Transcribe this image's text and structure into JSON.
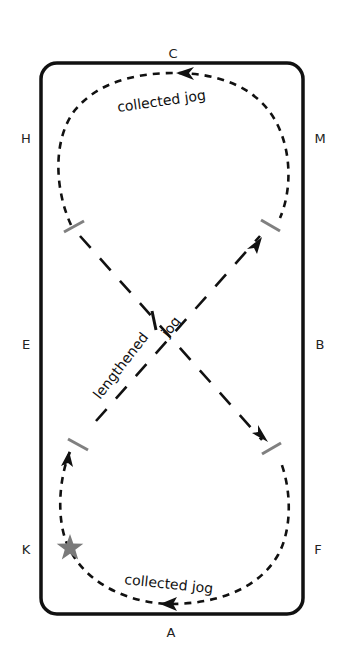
{
  "diagram": {
    "type": "dressage-figure",
    "figure": "figure-eight with collected jog circles and lengthened jog diagonals",
    "arena_letters": {
      "top": "C",
      "bottom": "A",
      "left": [
        "H",
        "E",
        "K"
      ],
      "right": [
        "M",
        "B",
        "F"
      ]
    },
    "letters": [
      {
        "id": "C",
        "label": "C",
        "x": 173,
        "y": 58
      },
      {
        "id": "H",
        "label": "H",
        "x": 26,
        "y": 143
      },
      {
        "id": "M",
        "label": "M",
        "x": 320,
        "y": 143
      },
      {
        "id": "E",
        "label": "E",
        "x": 26,
        "y": 349
      },
      {
        "id": "B",
        "label": "B",
        "x": 320,
        "y": 349
      },
      {
        "id": "K",
        "label": "K",
        "x": 26,
        "y": 554
      },
      {
        "id": "F",
        "label": "F",
        "x": 318,
        "y": 554
      },
      {
        "id": "A",
        "label": "A",
        "x": 171,
        "y": 637
      }
    ],
    "labels": {
      "top_circle": "collected jog",
      "bottom_circle": "collected jog",
      "diagonal_part1": "lengthened",
      "diagonal_part2": "jog"
    },
    "colors": {
      "line": "#111111",
      "marker": "#808080",
      "star": "#7a7a7a",
      "background": "#ffffff"
    },
    "start_marker": "star-icon"
  }
}
